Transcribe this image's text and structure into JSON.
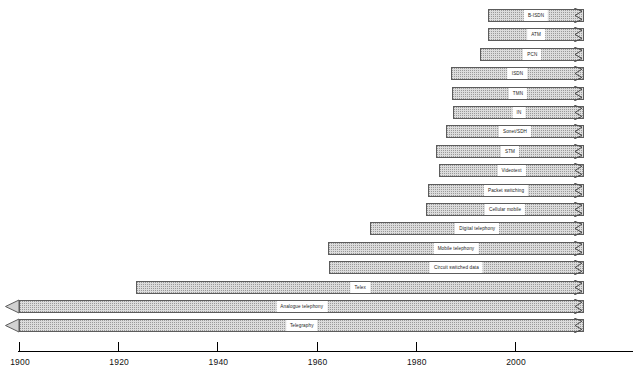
{
  "chart_data": {
    "type": "bar",
    "orientation": "horizontal",
    "title": "",
    "subtitle": "",
    "xlabel": "",
    "ylabel": "",
    "xlim": [
      1900,
      2014
    ],
    "grid": false,
    "legend": null,
    "axis": {
      "tick_labels": [
        "1900",
        "1920",
        "1940",
        "1960",
        "1980",
        "2000"
      ],
      "tick_values": [
        1900,
        1920,
        1940,
        1960,
        1980,
        2000
      ]
    },
    "note": "Gantt-style technology timeline. Each bar starts at the introduction year and continues to the present (shown by a torn right edge). The two oldest bars begin before 1900 and carry a left arrowhead.",
    "categories": [
      "B-ISDN",
      "ATM",
      "PCN",
      "ISDN",
      "TMN",
      "IN",
      "Sonet/SDH",
      "STM",
      "Videotext",
      "Packet switching",
      "Cellular mobile",
      "Digital telephony",
      "Mobile telephony",
      "Circuit switched data",
      "Telex",
      "Analogue telephony",
      "Telegraphy"
    ],
    "bars": [
      {
        "label": "B-ISDN",
        "start": 1994.5,
        "end": 2014,
        "continues_left": false,
        "continues_right": true
      },
      {
        "label": "ATM",
        "start": 1994.5,
        "end": 2014,
        "continues_left": false,
        "continues_right": true
      },
      {
        "label": "PCN",
        "start": 1993.0,
        "end": 2014,
        "continues_left": false,
        "continues_right": true
      },
      {
        "label": "ISDN",
        "start": 1987.0,
        "end": 2014,
        "continues_left": false,
        "continues_right": true
      },
      {
        "label": "TMN",
        "start": 1987.2,
        "end": 2014,
        "continues_left": false,
        "continues_right": true
      },
      {
        "label": "IN",
        "start": 1987.6,
        "end": 2014,
        "continues_left": false,
        "continues_right": true
      },
      {
        "label": "Sonet/SDH",
        "start": 1986.0,
        "end": 2014,
        "continues_left": false,
        "continues_right": true
      },
      {
        "label": "STM",
        "start": 1984.0,
        "end": 2014,
        "continues_left": false,
        "continues_right": true
      },
      {
        "label": "Videotext",
        "start": 1984.6,
        "end": 2014,
        "continues_left": false,
        "continues_right": true
      },
      {
        "label": "Packet switching",
        "start": 1982.4,
        "end": 2014,
        "continues_left": false,
        "continues_right": true
      },
      {
        "label": "Cellular mobile",
        "start": 1982.0,
        "end": 2014,
        "continues_left": false,
        "continues_right": true
      },
      {
        "label": "Digital telephony",
        "start": 1970.8,
        "end": 2014,
        "continues_left": false,
        "continues_right": true
      },
      {
        "label": "Mobile telephony",
        "start": 1962.2,
        "end": 2014,
        "continues_left": false,
        "continues_right": true
      },
      {
        "label": "Circuit switched data",
        "start": 1962.4,
        "end": 2014,
        "continues_left": false,
        "continues_right": true
      },
      {
        "label": "Telex",
        "start": 1923.6,
        "end": 2014,
        "continues_left": false,
        "continues_right": true
      },
      {
        "label": "Analogue telephony",
        "start": 1900.0,
        "end": 2014,
        "continues_left": true,
        "continues_right": true
      },
      {
        "label": "Telegraphy",
        "start": 1900.0,
        "end": 2014,
        "continues_left": true,
        "continues_right": true
      }
    ]
  },
  "style": {
    "bar_fill": "#dcdcdc",
    "bar_border": "#5c5c5c",
    "label_plate": "#ffffff",
    "axis_color": "#000000",
    "text_color": "#111111",
    "background": "#ffffff"
  }
}
